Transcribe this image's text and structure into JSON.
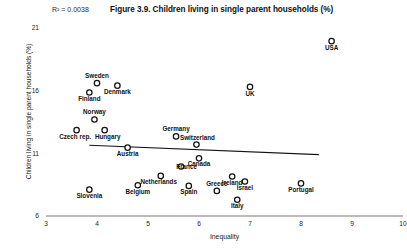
{
  "chart_data": {
    "type": "scatter",
    "title": "Figure 3.9. Children living in single parent households (%)",
    "xlabel": "Inequality",
    "ylabel": "Children living in single parent households (%)",
    "annotation": "R² = 0.0038",
    "r_squared": 0.0038,
    "xlim": [
      3,
      10
    ],
    "ylim": [
      6,
      21
    ],
    "xticks": [
      3,
      4,
      5,
      6,
      7,
      8,
      9,
      10
    ],
    "yticks": [
      6,
      11,
      16,
      21
    ],
    "grid": false,
    "legend": false,
    "marker_style": "open-circle",
    "trendline": {
      "visible": true,
      "x_start": 3.85,
      "y_start": 11.65,
      "x_end": 8.35,
      "y_end": 10.9
    },
    "points": [
      {
        "label": "USA",
        "x": 8.6,
        "y": 19.95,
        "label_dx": 0,
        "label_dy": 8.5
      },
      {
        "label": "Sweden",
        "x": 4.0,
        "y": 16.6,
        "label_dx": 0,
        "label_dy": -5.0
      },
      {
        "label": "Denmark",
        "x": 4.4,
        "y": 16.4,
        "label_dx": 0,
        "label_dy": 8.5
      },
      {
        "label": "Finland",
        "x": 3.85,
        "y": 15.85,
        "label_dx": 0,
        "label_dy": 8.5
      },
      {
        "label": "UK",
        "x": 7.0,
        "y": 16.3,
        "label_dx": 0,
        "label_dy": 9.0
      },
      {
        "label": "Norway",
        "x": 3.95,
        "y": 13.7,
        "label_dx": 0,
        "label_dy": -5.0
      },
      {
        "label": "Czech rep.",
        "x": 3.6,
        "y": 12.85,
        "label_dx": -1.5,
        "label_dy": 8.5
      },
      {
        "label": "Hungary",
        "x": 4.15,
        "y": 12.85,
        "label_dx": 3.0,
        "label_dy": 8.5
      },
      {
        "label": "Germany",
        "x": 5.55,
        "y": 12.35,
        "label_dx": 0,
        "label_dy": -5.0
      },
      {
        "label": "Switzerland",
        "x": 5.95,
        "y": 11.7,
        "label_dx": 1.0,
        "label_dy": -5.0
      },
      {
        "label": "Austria",
        "x": 4.6,
        "y": 11.45,
        "label_dx": 0,
        "label_dy": 8.5
      },
      {
        "label": "Canada",
        "x": 6.0,
        "y": 10.6,
        "label_dx": 0,
        "label_dy": 8.0
      },
      {
        "label": "France",
        "x": 5.65,
        "y": 9.95,
        "label_dx": 5.5,
        "label_dy": 2.8
      },
      {
        "label": "Ireland",
        "x": 6.65,
        "y": 9.15,
        "label_dx": 0,
        "label_dy": 8.5
      },
      {
        "label": "Netherlands",
        "x": 5.25,
        "y": 9.2,
        "label_dx": -2.0,
        "label_dy": 8.5
      },
      {
        "label": "Israel",
        "x": 6.9,
        "y": 8.75,
        "label_dx": 0,
        "label_dy": 8.5
      },
      {
        "label": "Portugal",
        "x": 8.0,
        "y": 8.6,
        "label_dx": 0,
        "label_dy": 8.5
      },
      {
        "label": "Belgium",
        "x": 4.8,
        "y": 8.45,
        "label_dx": 0,
        "label_dy": 8.5
      },
      {
        "label": "Spain",
        "x": 5.8,
        "y": 8.4,
        "label_dx": 0,
        "label_dy": 8.5
      },
      {
        "label": "Slovenia",
        "x": 3.85,
        "y": 8.1,
        "label_dx": 0,
        "label_dy": 8.5
      },
      {
        "label": "Greece",
        "x": 6.35,
        "y": 8.0,
        "label_dx": 0,
        "label_dy": -5.0
      },
      {
        "label": "Italy",
        "x": 6.75,
        "y": 7.3,
        "label_dx": 0,
        "label_dy": 8.5
      }
    ]
  }
}
